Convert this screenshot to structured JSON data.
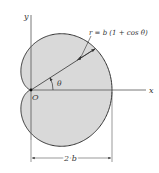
{
  "figure": {
    "type": "cardioid",
    "equation_label": "r = b (1 + cos θ)",
    "angle_label": "θ",
    "origin_label": "O",
    "x_axis_label": "x",
    "y_axis_label": "y",
    "dimension_label": "2 b",
    "fill_color": "#d9d9d9",
    "stroke_color": "#333333"
  }
}
